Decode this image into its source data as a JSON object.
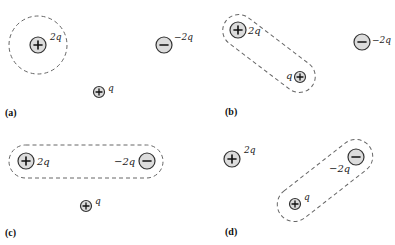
{
  "colors": {
    "charge_fill": "#dcdcdc",
    "charge_stroke": "#333333",
    "dashed_outline": "#666666",
    "background": "#ffffff"
  },
  "panels": [
    {
      "id": "a",
      "label": "(a)",
      "charges": [
        {
          "sign": "+",
          "value": "2q",
          "enclosed": true
        },
        {
          "sign": "-",
          "value": "−2q",
          "enclosed": false
        },
        {
          "sign": "+",
          "value": "q",
          "enclosed": false
        }
      ],
      "surface": "circle around +2q"
    },
    {
      "id": "b",
      "label": "(b)",
      "charges": [
        {
          "sign": "+",
          "value": "2q",
          "enclosed": true
        },
        {
          "sign": "+",
          "value": "q",
          "enclosed": true
        },
        {
          "sign": "-",
          "value": "−2q",
          "enclosed": false
        }
      ],
      "surface": "capsule around +2q and +q"
    },
    {
      "id": "c",
      "label": "(c)",
      "charges": [
        {
          "sign": "+",
          "value": "2q",
          "enclosed": true
        },
        {
          "sign": "-",
          "value": "−2q",
          "enclosed": true
        },
        {
          "sign": "+",
          "value": "q",
          "enclosed": false
        }
      ],
      "surface": "capsule around +2q and −2q"
    },
    {
      "id": "d",
      "label": "(d)",
      "charges": [
        {
          "sign": "+",
          "value": "2q",
          "enclosed": false
        },
        {
          "sign": "-",
          "value": "−2q",
          "enclosed": true
        },
        {
          "sign": "+",
          "value": "q",
          "enclosed": true
        }
      ],
      "surface": "capsule around −2q and +q"
    }
  ]
}
